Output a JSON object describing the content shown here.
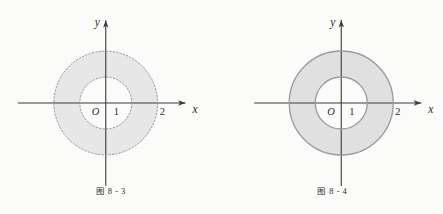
{
  "page": {
    "background_color": "#fbfbfa",
    "width": 443,
    "height": 214
  },
  "figures": [
    {
      "id": "figure-8-3",
      "caption": "图 8 - 3",
      "boundary_style": "dotted",
      "fill_color": "#e7e7e7",
      "stroke_color": "#9a9a9a",
      "axis_color": "#3a3a3a",
      "origin": {
        "x": 106,
        "y": 103
      },
      "unit_px": 26,
      "axes": {
        "x_label": "x",
        "y_label": "y",
        "origin_label": "O"
      },
      "tick_labels": [
        {
          "text": "1",
          "value": 1
        },
        {
          "text": "2",
          "value": 2
        }
      ],
      "region": {
        "inner_radius": 1,
        "outer_radius": 2
      }
    },
    {
      "id": "figure-8-4",
      "caption": "图 8 - 4",
      "boundary_style": "solid",
      "fill_color": "#e0e0e0",
      "stroke_color": "#9a9a9a",
      "axis_color": "#3a3a3a",
      "origin": {
        "x": 119,
        "y": 103
      },
      "unit_px": 26,
      "axes": {
        "x_label": "x",
        "y_label": "y",
        "origin_label": "O"
      },
      "tick_labels": [
        {
          "text": "1",
          "value": 1
        },
        {
          "text": "2",
          "value": 2
        }
      ],
      "region": {
        "inner_radius": 1,
        "outer_radius": 2
      }
    }
  ]
}
